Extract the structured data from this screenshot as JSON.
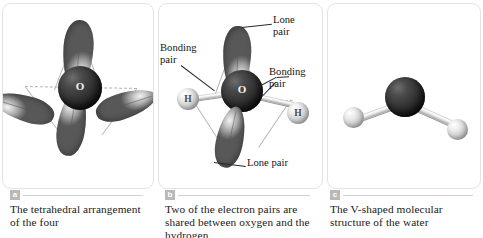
{
  "figure": {
    "panels": [
      {
        "id": "a",
        "badge": "a",
        "caption": "The tetrahedral\narrangement of the four",
        "diagram": "tetrahedral-orbitals"
      },
      {
        "id": "b",
        "badge": "b",
        "caption": "Two of the electron pairs are shared\nbetween oxygen and the hydrogen",
        "diagram": "water-orbitals-labeled"
      },
      {
        "id": "c",
        "badge": "c",
        "caption": "The V-shaped molecular\nstructure of the water",
        "diagram": "ball-and-stick-water"
      }
    ]
  },
  "panel_a": {
    "center_atom_label": "O",
    "lobe_count": 4,
    "lobe_labels": [
      "orbital-lobe-top",
      "orbital-lobe-left",
      "orbital-lobe-right",
      "orbital-lobe-bottom"
    ],
    "wireframe": "tetrahedron"
  },
  "panel_b": {
    "center_atom_label": "O",
    "hydrogen_left_label": "H",
    "hydrogen_right_label": "H",
    "annotations": [
      {
        "name": "lone-pair-top",
        "text": "Lone\npair"
      },
      {
        "name": "bonding-pair-left",
        "text": "Bonding\npair"
      },
      {
        "name": "bonding-pair-right",
        "text": "Bonding\npair"
      },
      {
        "name": "lone-pair-bottom",
        "text": "Lone pair"
      }
    ],
    "wireframe": "tetrahedron"
  },
  "panel_c": {
    "center_atom": "oxygen",
    "outer_atoms": [
      "hydrogen",
      "hydrogen"
    ],
    "geometry": "bent"
  },
  "colors": {
    "panel_border": "#e3e3e3",
    "oxygen": "#2e2e2e",
    "hydrogen": "#cfcfcf",
    "orbital": "#9a9a9a",
    "wireframe": "#b7b7b7",
    "dashed_guide": "#c0aaaa",
    "badge_bg": "#b9b9b9",
    "caption_text": "#1a1a1a",
    "background": "#ffffff"
  }
}
